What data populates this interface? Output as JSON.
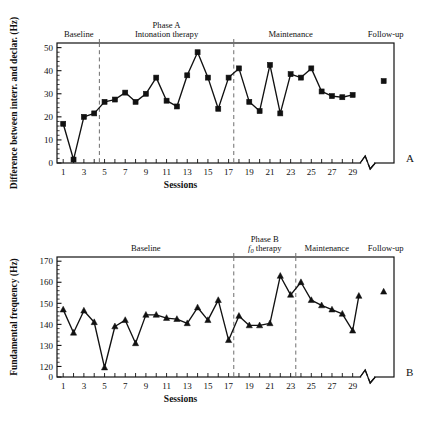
{
  "figure": {
    "panels": [
      {
        "letter": "A",
        "ylabel": "Difference between interr. and declar. (Hz)",
        "xlabel": "Sessions",
        "phase_labels": [
          {
            "lines": [
              "Baseline"
            ],
            "session_center": 2.5
          },
          {
            "lines": [
              "Phase A",
              "Intonation therapy"
            ],
            "session_center": 11.0
          },
          {
            "lines": [
              "Maintenance"
            ],
            "session_center": 23.0
          },
          {
            "lines": [
              "Follow-up"
            ],
            "session_center": 32.2
          }
        ],
        "dividers": [
          4.5,
          17.5
        ]
      },
      {
        "letter": "B",
        "ylabel": "Fundamental frequency (Hz)",
        "xlabel": "Sessions",
        "phase_labels": [
          {
            "lines": [
              "Baseline"
            ],
            "session_center": 9.0
          },
          {
            "lines": [
              "Phase B",
              "f0 therapy"
            ],
            "session_center": 20.5
          },
          {
            "lines": [
              "Maintenance"
            ],
            "session_center": 26.5
          },
          {
            "lines": [
              "Follow-up"
            ],
            "session_center": 32.2
          }
        ],
        "dividers": [
          17.5,
          23.5
        ]
      }
    ]
  },
  "chart_data": [
    {
      "type": "line",
      "panel": "A",
      "title": "",
      "xlabel": "Sessions",
      "ylabel": "Difference between interr. and declar. (Hz)",
      "marker": "square",
      "grid": false,
      "legend": null,
      "xlim": [
        0.4,
        33.0
      ],
      "ylim": [
        0,
        52
      ],
      "yticks": [
        0,
        10,
        20,
        30,
        40,
        50
      ],
      "xticks": [
        1,
        3,
        5,
        7,
        9,
        11,
        13,
        15,
        17,
        19,
        21,
        23,
        25,
        27,
        29
      ],
      "xtick_minor_every": 1,
      "axis_break_x": 30.6,
      "phases": [
        {
          "name": "Baseline",
          "sessions": [
            1,
            4
          ]
        },
        {
          "name": "Phase A / Intonation therapy",
          "sessions": [
            5,
            17
          ]
        },
        {
          "name": "Maintenance",
          "sessions": [
            18,
            29
          ]
        },
        {
          "name": "Follow-up",
          "sessions": [
            32,
            32
          ]
        }
      ],
      "x": [
        1,
        2,
        3,
        4,
        5,
        6,
        7,
        8,
        9,
        10,
        11,
        12,
        13,
        14,
        15,
        16,
        17,
        18,
        19,
        20,
        21,
        22,
        23,
        24,
        25,
        26,
        27,
        28,
        29
      ],
      "values": [
        17,
        1.5,
        20,
        21.5,
        26.5,
        27.5,
        30.5,
        26.5,
        30,
        37,
        27,
        24.5,
        38,
        48,
        37,
        23.5,
        37,
        41,
        26.5,
        22.5,
        42.5,
        21.5,
        38.5,
        37,
        41,
        31,
        29,
        28.5,
        29.5
      ],
      "followup": {
        "x": 32,
        "y": 35.5
      }
    },
    {
      "type": "line",
      "panel": "B",
      "title": "",
      "xlabel": "Sessions",
      "ylabel": "Fundamental frequency (Hz)",
      "marker": "triangle",
      "grid": false,
      "legend": null,
      "xlim": [
        0.4,
        33.0
      ],
      "ylim": [
        115,
        172
      ],
      "yticks": [
        120,
        130,
        140,
        150,
        160,
        170
      ],
      "ybreak_tick": 0,
      "xticks": [
        1,
        3,
        5,
        7,
        9,
        11,
        13,
        15,
        17,
        19,
        21,
        23,
        25,
        27,
        29
      ],
      "xtick_minor_every": 1,
      "axis_break_x": 30.6,
      "phases": [
        {
          "name": "Baseline",
          "sessions": [
            1,
            17
          ]
        },
        {
          "name": "Phase B / f0 therapy",
          "sessions": [
            18,
            23
          ]
        },
        {
          "name": "Maintenance",
          "sessions": [
            24,
            29
          ]
        },
        {
          "name": "Follow-up",
          "sessions": [
            32,
            32
          ]
        }
      ],
      "x": [
        1,
        2,
        3,
        4,
        5,
        6,
        7,
        8,
        9,
        10,
        11,
        12,
        13,
        14,
        15,
        16,
        17,
        18,
        19,
        20,
        21,
        22,
        23,
        24,
        25,
        26,
        27,
        28,
        29
      ],
      "values": [
        147,
        136,
        146.5,
        141,
        119.5,
        139,
        142,
        131,
        144.5,
        144.5,
        143,
        142.5,
        140.5,
        148,
        142,
        151.5,
        132.5,
        144,
        139.5,
        139.5,
        140.5,
        163,
        154,
        160,
        151.5,
        149,
        147,
        145,
        137
      ],
      "extra_point": {
        "x": 29.6,
        "y": 153.5
      },
      "followup": {
        "x": 32,
        "y": 155.5
      }
    }
  ]
}
